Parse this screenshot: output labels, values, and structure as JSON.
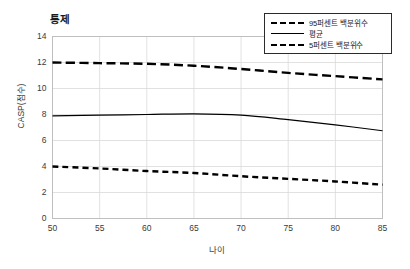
{
  "chart_data": {
    "type": "line",
    "title": "통제",
    "xlabel": "나이",
    "ylabel": "CASP(점수)",
    "xlim": [
      50,
      85
    ],
    "ylim": [
      0,
      14
    ],
    "xticks": [
      50,
      55,
      60,
      65,
      70,
      75,
      80,
      85
    ],
    "yticks": [
      0,
      2,
      4,
      6,
      8,
      10,
      12,
      14
    ],
    "grid": true,
    "legend_position": "top-right",
    "x": [
      50,
      55,
      60,
      65,
      70,
      75,
      80,
      85
    ],
    "series": [
      {
        "name": "95퍼센트 백분위수",
        "style": "dashed-long",
        "color": "#000000",
        "values": [
          12.0,
          11.95,
          11.9,
          11.75,
          11.5,
          11.2,
          10.95,
          10.7
        ]
      },
      {
        "name": "평균",
        "style": "solid",
        "color": "#000000",
        "values": [
          7.9,
          7.95,
          8.0,
          8.05,
          7.95,
          7.6,
          7.2,
          6.75
        ]
      },
      {
        "name": "5퍼센트 백분위수",
        "style": "dashed-short",
        "color": "#000000",
        "values": [
          4.0,
          3.85,
          3.65,
          3.5,
          3.25,
          3.05,
          2.85,
          2.6
        ]
      }
    ]
  },
  "legend": {
    "entries": [
      {
        "label": "95퍼센트 백분위수"
      },
      {
        "label": "평균"
      },
      {
        "label": "5퍼센트 백분위수"
      }
    ]
  },
  "colors": {
    "line": "#000000",
    "grid": "#d9d9d9",
    "axis": "#bfbfbf",
    "text": "#3a3a3a"
  }
}
